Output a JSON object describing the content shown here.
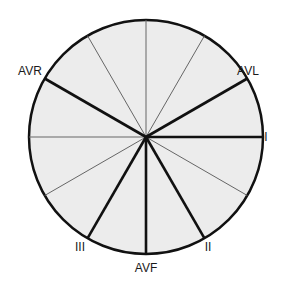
{
  "diagram": {
    "center": {
      "x": 146,
      "y": 137
    },
    "radius": 117,
    "fill": "#ececec",
    "stroke": "#111111",
    "leads": [
      {
        "name": "I",
        "angle": 0,
        "label": "I",
        "lx": 266,
        "ly": 141
      },
      {
        "name": "AVL",
        "angle": -30,
        "label": "AVL",
        "lx": 248,
        "ly": 75
      },
      {
        "name": "II",
        "angle": 60,
        "label": "II",
        "lx": 208,
        "ly": 251
      },
      {
        "name": "AVF",
        "angle": 90,
        "label": "AVF",
        "lx": 146,
        "ly": 272
      },
      {
        "name": "III",
        "angle": 120,
        "label": "III",
        "lx": 80,
        "ly": 251
      },
      {
        "name": "AVR",
        "angle": -150,
        "label": "AVR",
        "lx": 30,
        "ly": 75
      }
    ],
    "thin_spokes": [
      -60,
      -90,
      -120,
      180,
      150,
      30
    ]
  }
}
